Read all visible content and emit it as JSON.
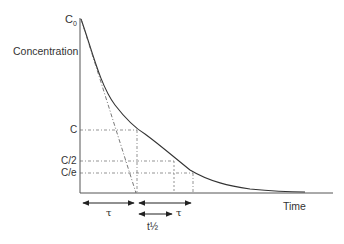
{
  "diagram": {
    "type": "exponential-decay",
    "y_axis": {
      "label": "Concentration",
      "top_label_main": "C",
      "top_label_sub": "0"
    },
    "x_axis": {
      "label": "Time"
    },
    "levels": [
      {
        "id": "C",
        "label": "C"
      },
      {
        "id": "C_half",
        "label": "C/2"
      },
      {
        "id": "C_e",
        "label": "C/e"
      }
    ],
    "intervals": [
      {
        "id": "tau_initial",
        "label": "τ"
      },
      {
        "id": "tau_second",
        "label": "τ"
      },
      {
        "id": "half_life",
        "label": "t½"
      }
    ],
    "colors": {
      "curve": "#333333",
      "guide": "#555555",
      "axis": "#444444"
    }
  }
}
